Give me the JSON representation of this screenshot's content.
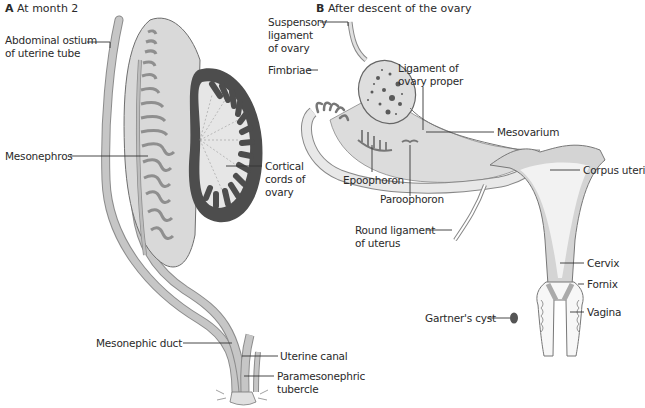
{
  "panel_a": {
    "letter": "A",
    "title": "At month 2",
    "labels": {
      "abdominal_ostium": "Abdominal ostium\nof uterine tube",
      "mesonephros": "Mesonephros",
      "cortical_cords": "Cortical\ncords of\novary",
      "mesonephric_duct": "Mesonephic duct",
      "uterine_canal": "Uterine canal",
      "paramesonephric_tubercle": "Paramesonephric\ntubercle"
    }
  },
  "panel_b": {
    "letter": "B",
    "title": "After descent of the ovary",
    "labels": {
      "suspensory_ligament": "Suspensory\nligament\nof ovary",
      "fimbriae": "Fimbriae",
      "ligament_ovary_proper": "Ligament of\novary proper",
      "mesovarium": "Mesovarium",
      "epoophoron": "Epoophoron",
      "paroophoron": "Paroophoron",
      "corpus_uteri": "Corpus uteri",
      "round_ligament": "Round ligament\nof uterus",
      "cervix": "Cervix",
      "fornix": "Fornix",
      "gartners_cyst": "Gartner's cyst",
      "vagina": "Vagina"
    }
  },
  "colors": {
    "tissue_light": "#e2e2e2",
    "tissue_mid": "#c4c4c4",
    "duct": "#b3b3b3",
    "cortex_dark": "#4d4d4d",
    "outline": "#555555"
  }
}
